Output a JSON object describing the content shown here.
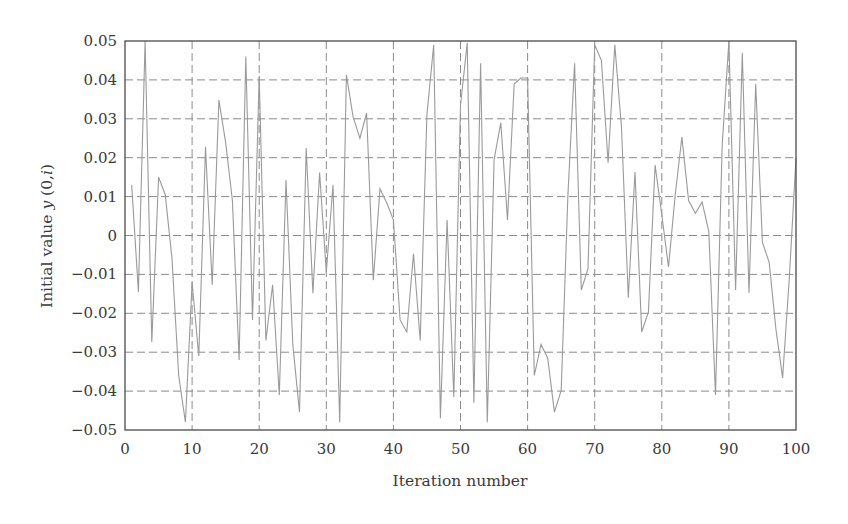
{
  "chart_data": {
    "type": "line",
    "title": "",
    "xlabel": "Iteration number",
    "ylabel": "Initial value y (0,i)",
    "ylabel_parts": [
      {
        "text": "Initial value ",
        "italic": false
      },
      {
        "text": "y",
        "italic": true
      },
      {
        "text": " (0,",
        "italic": false
      },
      {
        "text": "i",
        "italic": true
      },
      {
        "text": ")",
        "italic": false
      }
    ],
    "xlim": [
      0,
      100
    ],
    "ylim": [
      -0.05,
      0.05
    ],
    "xticks": [
      0,
      10,
      20,
      30,
      40,
      50,
      60,
      70,
      80,
      90,
      100
    ],
    "xtick_labels": [
      "0",
      "10",
      "20",
      "30",
      "40",
      "50",
      "60",
      "70",
      "80",
      "90",
      "100"
    ],
    "yticks": [
      0.05,
      0.04,
      0.03,
      0.02,
      0.01,
      0,
      -0.01,
      -0.02,
      -0.03,
      -0.04,
      -0.05
    ],
    "ytick_labels": [
      "0.05",
      "0.04",
      "0.03",
      "0.02",
      "0.01",
      "0",
      "−0.01",
      "−0.02",
      "−0.03",
      "−0.04",
      "−0.05"
    ],
    "grid": true,
    "grid_style": "dashed",
    "legend": null,
    "colors": {
      "line": "#9a9a9a",
      "grid": "#8a8a8a",
      "frame": "#4a4a4a",
      "text": "#3a3a3a"
    },
    "series": [
      {
        "name": "y(0,i)",
        "x": [
          1,
          2,
          3,
          4,
          5,
          6,
          7,
          8,
          9,
          10,
          11,
          12,
          13,
          14,
          15,
          16,
          17,
          18,
          19,
          20,
          21,
          22,
          23,
          24,
          25,
          26,
          27,
          28,
          29,
          30,
          31,
          32,
          33,
          34,
          35,
          36,
          37,
          38,
          39,
          40,
          41,
          42,
          43,
          44,
          45,
          46,
          47,
          48,
          49,
          50,
          51,
          52,
          53,
          54,
          55,
          56,
          57,
          58,
          59,
          60,
          61,
          62,
          63,
          64,
          65,
          66,
          67,
          68,
          69,
          70,
          71,
          72,
          73,
          74,
          75,
          76,
          77,
          78,
          79,
          80,
          81,
          82,
          83,
          84,
          85,
          86,
          87,
          88,
          89,
          90,
          91,
          92,
          93,
          94,
          95,
          96,
          97,
          98,
          99,
          100
        ],
        "values": [
          0.013,
          -0.0145,
          0.05,
          -0.0274,
          0.015,
          0.0104,
          -0.006,
          -0.036,
          -0.048,
          -0.012,
          -0.031,
          0.0228,
          -0.0127,
          0.0348,
          0.024,
          0.009,
          -0.032,
          0.046,
          -0.0217,
          0.041,
          -0.027,
          -0.0127,
          -0.041,
          0.0143,
          -0.028,
          -0.0454,
          0.0225,
          -0.0148,
          0.0162,
          -0.0094,
          0.013,
          -0.048,
          0.0413,
          0.0305,
          0.025,
          0.0315,
          -0.0115,
          0.012,
          0.0084,
          0.004,
          -0.0217,
          -0.0248,
          -0.0047,
          -0.027,
          0.031,
          0.049,
          -0.047,
          0.004,
          -0.0415,
          0.0335,
          0.0495,
          -0.043,
          0.0443,
          -0.048,
          0.0195,
          0.029,
          0.004,
          0.039,
          0.0405,
          0.0405,
          -0.036,
          -0.028,
          -0.0315,
          -0.0454,
          -0.0398,
          0.0104,
          0.0443,
          -0.014,
          -0.0085,
          0.049,
          0.045,
          0.0187,
          0.049,
          0.0277,
          -0.016,
          0.0163,
          -0.0248,
          -0.0197,
          0.0181,
          0.0053,
          -0.0081,
          0.0104,
          0.0253,
          0.009,
          0.0057,
          0.0086,
          0.001,
          -0.041,
          0.0233,
          0.05,
          -0.014,
          0.047,
          -0.0148,
          0.039,
          -0.0017,
          -0.007,
          -0.024,
          -0.0366,
          -0.011,
          0.0199
        ]
      }
    ]
  }
}
